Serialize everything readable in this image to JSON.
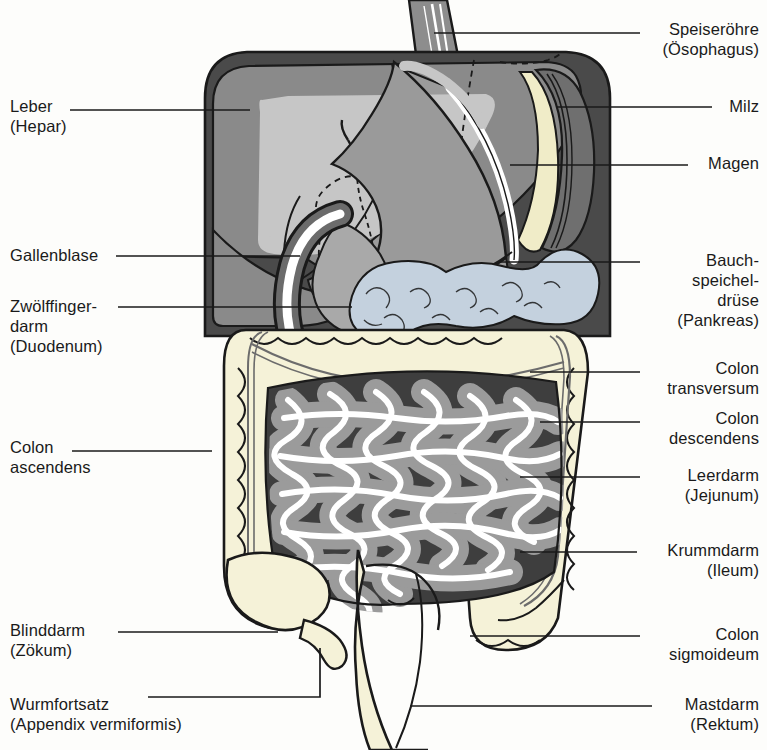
{
  "figure": {
    "title_semantic": "human-digestive-system-abdominal-organs-diagram",
    "language": "de",
    "background_color": "#fdfdfb",
    "line_color": "#1a1a1a"
  },
  "palette": {
    "abdomen_dark": "#4a4a4a",
    "liver_mid": "#8a8a8a",
    "liver_light": "#c6c6c6",
    "stomach_gray": "#9a9a9a",
    "stomach_highlight": "#ffffff",
    "spleen_cream": "#f0ecc8",
    "pancreas_blue": "#c4d1de",
    "colon_cream": "#f5f2d8",
    "small_intestine_gray": "#9b9b9b",
    "small_intestine_lumen": "#ffffff",
    "outline": "#1a1a1a"
  },
  "labels_left": [
    {
      "id": "leber",
      "lines": [
        "Leber",
        "(Hepar)"
      ],
      "x": 10,
      "y": 96,
      "leader": {
        "x1": 70,
        "y1": 110,
        "x2": 250,
        "y2": 110
      }
    },
    {
      "id": "gallenblase",
      "lines": [
        "Gallenblase"
      ],
      "x": 10,
      "y": 245,
      "leader": {
        "x1": 116,
        "y1": 256,
        "x2": 300,
        "y2": 256
      }
    },
    {
      "id": "zwoelffingerdarm",
      "lines": [
        "Zwölffinger-",
        "darm",
        "(Duodenum)"
      ],
      "x": 10,
      "y": 296,
      "leader": {
        "x1": 118,
        "y1": 307,
        "x2": 352,
        "y2": 307
      }
    },
    {
      "id": "colon-ascendens",
      "lines": [
        "Colon",
        "ascendens"
      ],
      "x": 10,
      "y": 437,
      "leader": {
        "x1": 72,
        "y1": 451,
        "x2": 212,
        "y2": 451
      }
    },
    {
      "id": "blinddarm",
      "lines": [
        "Blinddarm",
        "(Zökum)"
      ],
      "x": 10,
      "y": 620,
      "leader": {
        "x1": 118,
        "y1": 632,
        "x2": 278,
        "y2": 632
      }
    },
    {
      "id": "wurmfortsatz",
      "lines": [
        "Wurmfortsatz",
        "(Appendix vermiformis)"
      ],
      "x": 10,
      "y": 694,
      "leader": {
        "x1": 148,
        "y1": 697,
        "x2": 320,
        "y2": 697,
        "x3": 320,
        "y3": 648
      }
    }
  ],
  "labels_right": [
    {
      "id": "speiseroehre",
      "lines": [
        "Speiseröhre",
        "(Ösophagus)"
      ],
      "x": 648,
      "y": 19,
      "leader": {
        "x1": 434,
        "y1": 33,
        "x2": 640,
        "y2": 33
      }
    },
    {
      "id": "milz",
      "lines": [
        "Milz"
      ],
      "x": 720,
      "y": 96,
      "leader": {
        "x1": 556,
        "y1": 107,
        "x2": 712,
        "y2": 107
      }
    },
    {
      "id": "magen",
      "lines": [
        "Magen"
      ],
      "x": 696,
      "y": 153,
      "leader": {
        "x1": 510,
        "y1": 165,
        "x2": 688,
        "y2": 165
      }
    },
    {
      "id": "pankreas",
      "lines": [
        "Bauch-",
        "speichel-",
        "drüse",
        "(Pankreas)"
      ],
      "x": 596,
      "y": 250,
      "leader": {
        "x1": 500,
        "y1": 262,
        "x2": 640,
        "y2": 262
      }
    },
    {
      "id": "colon-transversum",
      "lines": [
        "Colon",
        "transversum"
      ],
      "x": 648,
      "y": 358,
      "leader": {
        "x1": 530,
        "y1": 372,
        "x2": 640,
        "y2": 372
      }
    },
    {
      "id": "colon-descendens",
      "lines": [
        "Colon",
        "descendens"
      ],
      "x": 648,
      "y": 408,
      "leader": {
        "x1": 540,
        "y1": 422,
        "x2": 640,
        "y2": 422
      }
    },
    {
      "id": "leerdarm",
      "lines": [
        "Leerdarm",
        "(Jejunum)"
      ],
      "x": 648,
      "y": 465,
      "leader": {
        "x1": 520,
        "y1": 477,
        "x2": 640,
        "y2": 477
      }
    },
    {
      "id": "krummdarm",
      "lines": [
        "Krummdarm",
        "(Ileum)"
      ],
      "x": 645,
      "y": 540,
      "leader": {
        "x1": 520,
        "y1": 552,
        "x2": 637,
        "y2": 552
      }
    },
    {
      "id": "colon-sigmoideum",
      "lines": [
        "Colon",
        "sigmoideum"
      ],
      "x": 648,
      "y": 624,
      "leader": {
        "x1": 470,
        "y1": 636,
        "x2": 640,
        "y2": 636
      }
    },
    {
      "id": "mastdarm",
      "lines": [
        "Mastdarm",
        "(Rektum)"
      ],
      "x": 660,
      "y": 694,
      "leader": {
        "x1": 410,
        "y1": 706,
        "x2": 652,
        "y2": 706
      }
    }
  ]
}
